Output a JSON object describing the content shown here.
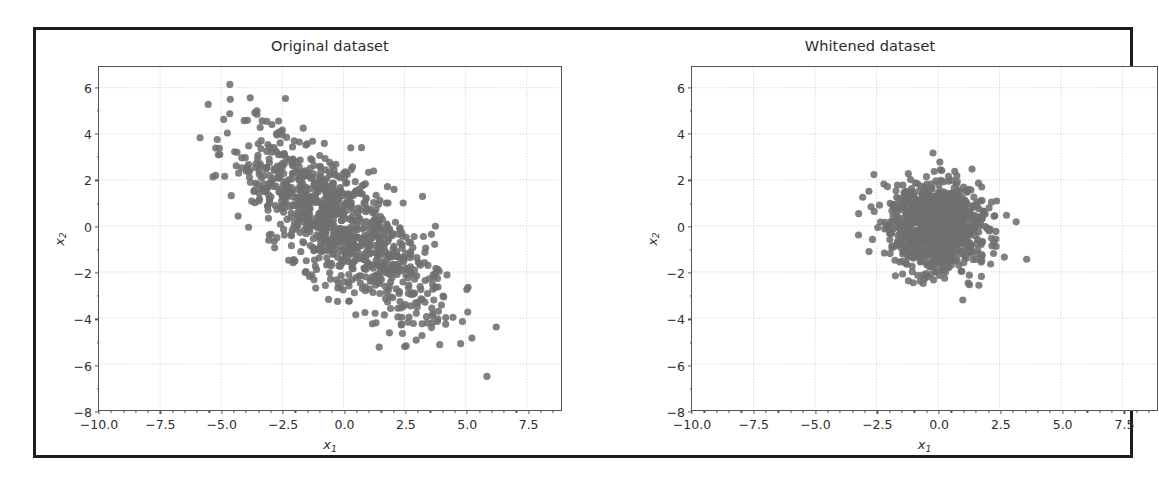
{
  "figure": {
    "background": "#ffffff",
    "frame_color": "#1c1c1c",
    "marker_color": "#6f6f6f",
    "grid_color": "#cfcfcf",
    "axis_color": "#555555"
  },
  "chart_data": [
    {
      "type": "scatter",
      "title": "Original dataset",
      "xlabel": "x1",
      "ylabel": "x2",
      "xlim": [
        -10.0,
        8.9
      ],
      "ylim": [
        -8.0,
        6.9
      ],
      "xticks": [
        -10.0,
        -7.5,
        -5.0,
        -2.5,
        0.0,
        2.5,
        5.0,
        7.5
      ],
      "xticklabels": [
        "-10.0",
        "-7.5",
        "-5.0",
        "-2.5",
        "0.0",
        "2.5",
        "5.0",
        "7.5"
      ],
      "yticks": [
        6,
        4,
        2,
        0,
        -2,
        -4,
        -6,
        -8
      ],
      "yticklabels": [
        "6",
        "4",
        "2",
        "0",
        "-2",
        "-4",
        "-6",
        "-8"
      ],
      "grid": true,
      "legend": null,
      "n_points": 1000,
      "marker_size": 6,
      "marker_color": "#6f6f6f",
      "distribution": {
        "kind": "gaussian",
        "mean": [
          -0.15,
          0.0
        ],
        "cov": [
          [
            4.2,
            -3.1
          ],
          [
            -3.1,
            4.0
          ]
        ],
        "correlation": -0.76,
        "note": "correlated elliptical cloud tilted along the negative diagonal"
      }
    },
    {
      "type": "scatter",
      "title": "Whitened dataset",
      "xlabel": "x1",
      "ylabel": "x2",
      "xlim": [
        -10.0,
        8.9
      ],
      "ylim": [
        -8.0,
        6.9
      ],
      "xticks": [
        -10.0,
        -7.5,
        -5.0,
        -2.5,
        0.0,
        2.5,
        5.0,
        7.5
      ],
      "xticklabels": [
        "-10.0",
        "-7.5",
        "-5.0",
        "-2.5",
        "0.0",
        "2.5",
        "5.0",
        "7.5"
      ],
      "yticks": [
        6,
        4,
        2,
        0,
        -2,
        -4,
        -6,
        -8
      ],
      "yticklabels": [
        "6",
        "4",
        "2",
        "0",
        "-2",
        "-4",
        "-6",
        "-8"
      ],
      "grid": true,
      "legend": null,
      "n_points": 1000,
      "marker_size": 6,
      "marker_color": "#6f6f6f",
      "distribution": {
        "kind": "gaussian",
        "mean": [
          0.0,
          0.0
        ],
        "cov": [
          [
            1.0,
            0.0
          ],
          [
            0.0,
            1.0
          ]
        ],
        "correlation": 0.0,
        "note": "isotropic unit-variance circular cloud"
      }
    }
  ]
}
